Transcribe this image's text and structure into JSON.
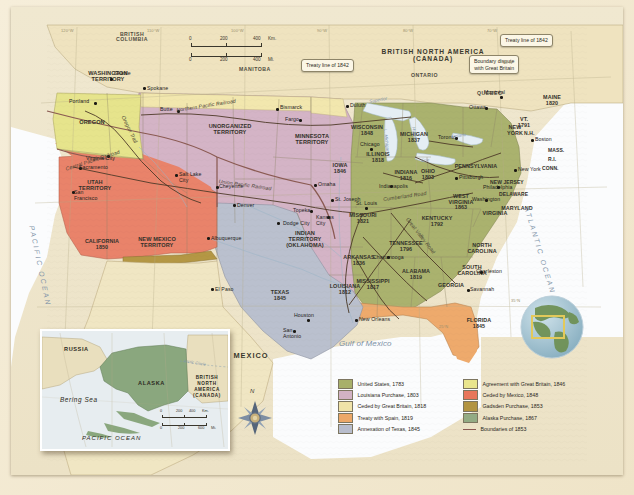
{
  "map": {
    "title": "United States Territorial Expansion",
    "scale_bar": {
      "km_label": "Km.",
      "mi_label": "Mi.",
      "km_ticks": [
        "0",
        "200",
        "400"
      ],
      "mi_ticks": [
        "0",
        "200",
        "400"
      ]
    },
    "compass": {
      "north_label": "N"
    },
    "oceans": [
      {
        "name": "pacific-ocean-label",
        "text": "PACIFIC OCEAN"
      },
      {
        "name": "atlantic-ocean-label",
        "text": "ATLANTIC OCEAN"
      },
      {
        "name": "gulf-of-mexico-label",
        "text": "Gulf of Mexico"
      }
    ],
    "foreign": [
      {
        "name": "british-north-america-label",
        "text": "BRITISH NORTH AMERICA\n(CANADA)"
      },
      {
        "name": "mexico-label",
        "text": "MEXICO"
      }
    ],
    "provinces": [
      {
        "name": "british-columbia-label",
        "text": "BRITISH\nCOLUMBIA"
      },
      {
        "name": "manitoba-label",
        "text": "MANITOBA"
      },
      {
        "name": "ontario-label",
        "text": "ONTARIO"
      },
      {
        "name": "quebec-label",
        "text": "QUEBEC"
      }
    ],
    "callouts": [
      {
        "name": "callout-treaty-line-1842-west",
        "text": "Treaty line of 1842"
      },
      {
        "name": "callout-treaty-line-1842-east",
        "text": "Treaty line of 1842"
      },
      {
        "name": "callout-boundary-dispute",
        "text": "Boundary dispute\nwith Great Britain"
      }
    ],
    "territories": [
      {
        "name": "washington-territory-label",
        "text": "WASHINGTON\nTERRITORY"
      },
      {
        "name": "oregon-label",
        "text": "OREGON"
      },
      {
        "name": "utah-territory-label",
        "text": "UTAH\nTERRITORY"
      },
      {
        "name": "new-mexico-territory-label",
        "text": "NEW MEXICO\nTERRITORY"
      },
      {
        "name": "unorganized-territory-label",
        "text": "UNORGANIZED\nTERRITORY"
      },
      {
        "name": "minnesota-territory-label",
        "text": "MINNESOTA\nTERRITORY"
      },
      {
        "name": "indian-territory-label",
        "text": "INDIAN\nTERRITORY\n(OKLAHOMA)"
      }
    ],
    "states": [
      {
        "name": "california-label",
        "text": "CALIFORNIA\n1850"
      },
      {
        "name": "texas-label",
        "text": "TEXAS\n1845"
      },
      {
        "name": "missouri-label",
        "text": "MISSOURI\n1821"
      },
      {
        "name": "arkansas-label",
        "text": "ARKANSAS\n1836"
      },
      {
        "name": "louisiana-label",
        "text": "LOUISIANA\n1812"
      },
      {
        "name": "mississippi-label",
        "text": "MISSISSIPPI\n1817"
      },
      {
        "name": "alabama-label",
        "text": "ALABAMA\n1819"
      },
      {
        "name": "georgia-label",
        "text": "GEORGIA"
      },
      {
        "name": "florida-label",
        "text": "FLORIDA\n1845"
      },
      {
        "name": "tennessee-label",
        "text": "TENNESSEE\n1796"
      },
      {
        "name": "kentucky-label",
        "text": "KENTUCKY\n1792"
      },
      {
        "name": "north-carolina-label",
        "text": "NORTH\nCAROLINA"
      },
      {
        "name": "south-carolina-label",
        "text": "SOUTH\nCAROLINA"
      },
      {
        "name": "virginia-label",
        "text": "VIRGINIA"
      },
      {
        "name": "west-virginia-label",
        "text": "WEST\nVIRGINIA\n1863"
      },
      {
        "name": "maryland-label",
        "text": "MARYLAND"
      },
      {
        "name": "delaware-label",
        "text": "DELAWARE"
      },
      {
        "name": "new-jersey-label",
        "text": "NEW JERSEY"
      },
      {
        "name": "pennsylvania-label",
        "text": "PENNSYLVANIA"
      },
      {
        "name": "new-york-state-label",
        "text": "NEW\nYORK"
      },
      {
        "name": "maine-label",
        "text": "MAINE\n1820"
      },
      {
        "name": "vermont-label",
        "text": "VT.\n1791"
      },
      {
        "name": "new-hampshire-label",
        "text": "N.H."
      },
      {
        "name": "massachusetts-label",
        "text": "MASS."
      },
      {
        "name": "rhode-island-label",
        "text": "R.I."
      },
      {
        "name": "connecticut-label",
        "text": "CONN."
      },
      {
        "name": "ohio-label",
        "text": "OHIO\n1803"
      },
      {
        "name": "indiana-label",
        "text": "INDIANA\n1816"
      },
      {
        "name": "illinois-label",
        "text": "ILLINOIS\n1818"
      },
      {
        "name": "michigan-label",
        "text": "MICHIGAN\n1837"
      },
      {
        "name": "wisconsin-label",
        "text": "WISCONSIN\n1848"
      },
      {
        "name": "iowa-label",
        "text": "IOWA\n1846"
      }
    ],
    "cities": [
      {
        "name": "city-seattle",
        "text": "Seattle"
      },
      {
        "name": "city-spokane",
        "text": "Spokane"
      },
      {
        "name": "city-portland",
        "text": "Portland"
      },
      {
        "name": "city-butte",
        "text": "Butte"
      },
      {
        "name": "city-virginia-city",
        "text": "Virginia City"
      },
      {
        "name": "city-sacramento",
        "text": "Sacramento"
      },
      {
        "name": "city-san-francisco",
        "text": "San\nFrancisco"
      },
      {
        "name": "city-salt-lake-city",
        "text": "Salt Lake\nCity"
      },
      {
        "name": "city-cheyenne",
        "text": "Cheyenne"
      },
      {
        "name": "city-denver",
        "text": "Denver"
      },
      {
        "name": "city-albuquerque",
        "text": "Albuquerque"
      },
      {
        "name": "city-el-paso",
        "text": "El Paso"
      },
      {
        "name": "city-bismarck",
        "text": "Bismarck"
      },
      {
        "name": "city-fargo",
        "text": "Fargo"
      },
      {
        "name": "city-duluth",
        "text": "Duluth"
      },
      {
        "name": "city-omaha",
        "text": "Omaha"
      },
      {
        "name": "city-topeka",
        "text": "Topeka"
      },
      {
        "name": "city-kansas-city",
        "text": "Kansas\nCity"
      },
      {
        "name": "city-st-joseph",
        "text": "St. Joseph"
      },
      {
        "name": "city-st-louis",
        "text": "St. Louis"
      },
      {
        "name": "city-dodge-city",
        "text": "Dodge City"
      },
      {
        "name": "city-houston",
        "text": "Houston"
      },
      {
        "name": "city-san-antonio",
        "text": "San\nAntonio"
      },
      {
        "name": "city-new-orleans",
        "text": "New Orleans"
      },
      {
        "name": "city-chicago",
        "text": "Chicago"
      },
      {
        "name": "city-indianapolis",
        "text": "Indianapolis"
      },
      {
        "name": "city-chattanooga",
        "text": "Chattanooga"
      },
      {
        "name": "city-charleston",
        "text": "Charleston"
      },
      {
        "name": "city-savannah",
        "text": "Savannah"
      },
      {
        "name": "city-toronto",
        "text": "Toronto"
      },
      {
        "name": "city-montreal",
        "text": "Montréal"
      },
      {
        "name": "city-ottawa",
        "text": "Ottawa"
      },
      {
        "name": "city-boston",
        "text": "Boston"
      },
      {
        "name": "city-new-york",
        "text": "New York"
      },
      {
        "name": "city-philadelphia",
        "text": "Philadelphia"
      },
      {
        "name": "city-pittsburgh",
        "text": "Pittsburgh"
      },
      {
        "name": "city-washington",
        "text": "Washington"
      }
    ],
    "routes": [
      {
        "name": "oregon-trail-label",
        "text": "Oregon Trail"
      },
      {
        "name": "northern-pacific-railroad-label",
        "text": "Northern Pacific Railroad"
      },
      {
        "name": "central-pacific-railroad-label",
        "text": "Central Pacific Railroad"
      },
      {
        "name": "union-pacific-railroad-label",
        "text": "Union Pacific Railroad"
      },
      {
        "name": "cumberland-road-label",
        "text": "Cumberland Road"
      },
      {
        "name": "great-valley-road-label",
        "text": "Great Valley Road"
      }
    ],
    "water_labels": [
      {
        "name": "lake-superior-label",
        "text": "Superior"
      },
      {
        "name": "lake-michigan-label",
        "text": "L. Michigan"
      },
      {
        "name": "lake-huron-label",
        "text": "Huron"
      },
      {
        "name": "lake-erie-label",
        "text": "Erie"
      },
      {
        "name": "lake-ontario-label",
        "text": "Ontario"
      }
    ],
    "graticule": [
      {
        "name": "lon-120w",
        "text": "120°W"
      },
      {
        "name": "lon-110w",
        "text": "110°W"
      },
      {
        "name": "lon-100w",
        "text": "100°W"
      },
      {
        "name": "lon-90w",
        "text": "90°W"
      },
      {
        "name": "lon-80w",
        "text": "80°W"
      },
      {
        "name": "lon-70w",
        "text": "70°W"
      },
      {
        "name": "lat-45n",
        "text": "45°N"
      },
      {
        "name": "lat-35n",
        "text": "35°N"
      },
      {
        "name": "lat-25n",
        "text": "25°N"
      }
    ]
  },
  "inset": {
    "name": "alaska-inset",
    "labels": [
      {
        "name": "russia-label",
        "text": "RUSSIA"
      },
      {
        "name": "alaska-label",
        "text": "ALASKA"
      },
      {
        "name": "inset-british-north-america-label",
        "text": "BRITISH\nNORTH\nAMERICA\n(CANADA)"
      },
      {
        "name": "bering-sea-label",
        "text": "Bering Sea"
      },
      {
        "name": "inset-pacific-ocean-label",
        "text": "PACIFIC OCEAN"
      },
      {
        "name": "arctic-circle-label",
        "text": "Arctic Circle"
      }
    ],
    "scale_bar": {
      "km_label": "Km.",
      "mi_label": "Mi.",
      "km_ticks": [
        "0",
        "200",
        "400"
      ],
      "mi_ticks": [
        "0",
        "200",
        "600"
      ]
    }
  },
  "legend": {
    "name": "map-legend",
    "column1": [
      {
        "label": "United States, 1783",
        "color": "#a8b06a"
      },
      {
        "label": "Louisiana Purchase, 1803",
        "color": "#d2b2c4"
      },
      {
        "label": "Ceded by Great Britain, 1818",
        "color": "#f0e3a8"
      },
      {
        "label": "Treaty with Spain, 1819",
        "color": "#eca868"
      },
      {
        "label": "Annexation of Texas, 1845",
        "color": "#b8bdcc"
      }
    ],
    "column2": [
      {
        "label": "Agreement with Great Britain, 1846",
        "color": "#e9e58d"
      },
      {
        "label": "Ceded by Mexico, 1848",
        "color": "#e8765a"
      },
      {
        "label": "Gadsden Purchase, 1853",
        "color": "#b29441"
      },
      {
        "label": "Alaska Purchase, 1867",
        "color": "#93ab84"
      }
    ],
    "boundaries": {
      "label": "Boundaries of 1853",
      "color": "#8a5a52"
    }
  },
  "globe": {
    "name": "globe-locator-inset",
    "highlight_color": "#e3c95a"
  }
}
